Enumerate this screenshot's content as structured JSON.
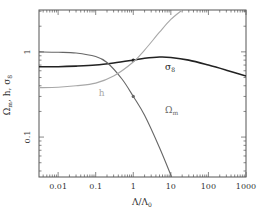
{
  "chart_data": {
    "type": "line",
    "title": "",
    "xlabel": "Λ/Λ0",
    "ylabel": "Ωm, h, σ8",
    "xscale": "log",
    "yscale": "log",
    "xlim": [
      0.0031,
      1000
    ],
    "ylim": [
      0.034,
      3.1
    ],
    "grid": false,
    "legend": "inline labels",
    "x_ticks": [
      {
        "value": 0.01,
        "label": "0.01"
      },
      {
        "value": 0.1,
        "label": "0.1"
      },
      {
        "value": 1,
        "label": "1"
      },
      {
        "value": 10,
        "label": "10"
      },
      {
        "value": 100,
        "label": "100"
      },
      {
        "value": 1000,
        "label": "1000"
      }
    ],
    "y_ticks": [
      {
        "value": 0.1,
        "label": "0.1"
      },
      {
        "value": 1,
        "label": "1"
      }
    ],
    "series": [
      {
        "name": "σ8",
        "label": "σ8",
        "color": "#222222",
        "width": 1.6,
        "x": [
          0.0031,
          0.01,
          0.03,
          0.1,
          0.3,
          1,
          2,
          5,
          10,
          30,
          100,
          300,
          1000
        ],
        "values": [
          0.67,
          0.67,
          0.68,
          0.7,
          0.74,
          0.8,
          0.84,
          0.87,
          0.86,
          0.8,
          0.7,
          0.61,
          0.52
        ],
        "marker": {
          "x": 1,
          "y": 0.8
        },
        "label_pos": {
          "x": 7,
          "y": 0.62
        }
      },
      {
        "name": "Ωm",
        "label": "Ωm",
        "color": "#666666",
        "width": 1.1,
        "x": [
          0.0031,
          0.01,
          0.03,
          0.1,
          0.2,
          0.5,
          1,
          2,
          5,
          10.5
        ],
        "values": [
          1.0,
          0.99,
          0.97,
          0.88,
          0.75,
          0.48,
          0.3,
          0.18,
          0.075,
          0.034
        ],
        "marker": {
          "x": 1,
          "y": 0.3
        },
        "label_pos": {
          "x": 7,
          "y": 0.19
        }
      },
      {
        "name": "h",
        "label": "h",
        "color": "#a8a8a8",
        "width": 1.1,
        "x": [
          0.0031,
          0.01,
          0.03,
          0.1,
          0.3,
          1,
          2,
          5,
          10,
          20
        ],
        "values": [
          0.38,
          0.385,
          0.4,
          0.43,
          0.52,
          0.76,
          1.05,
          1.7,
          2.4,
          3.1
        ],
        "label_pos": {
          "x": 0.12,
          "y": 0.3
        }
      }
    ]
  }
}
